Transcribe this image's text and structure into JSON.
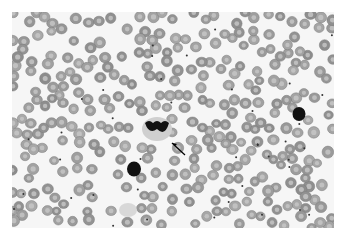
{
  "image": {
    "subject": "peripheral blood smear micrograph (grayscale)",
    "background_color": "#ffffff",
    "field_color": "#f6f6f6",
    "rbc_color": "#9a9a9a",
    "rbc_center_color": "#c8c8c8",
    "nucleus_color": "#111111"
  },
  "features": {
    "neutrophil": {
      "cx": 157,
      "cy": 129,
      "label": ""
    },
    "lymphocyte_1": {
      "cx": 134,
      "cy": 169
    },
    "lymphocyte_2": {
      "cx": 299,
      "cy": 114
    },
    "arrow": {
      "x1": 185,
      "y1": 155,
      "x2": 172,
      "y2": 143
    },
    "smudge": {
      "cx": 128,
      "cy": 210
    }
  }
}
